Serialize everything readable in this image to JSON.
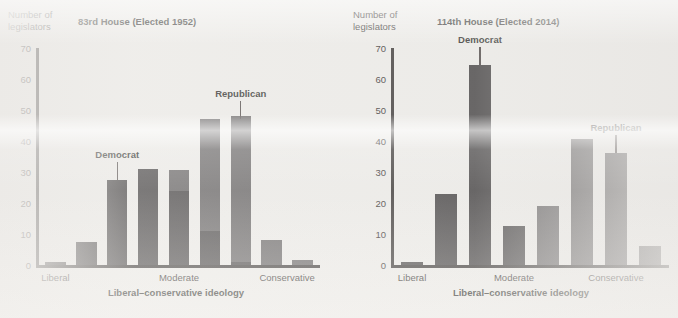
{
  "figure": {
    "background_color": "#ecebe8",
    "democrat_color": "#3c3a3b",
    "republican_color": "#5c5a5b",
    "axis_color": "#2e2b2a"
  },
  "chart_data": [
    {
      "type": "bar",
      "panel": "left",
      "title": "83rd House (Elected 1952)",
      "ylabel": "Number of\nlegislators",
      "xlabel": "Liberal–conservative ideology",
      "ylim": [
        0,
        70
      ],
      "yticks": [
        0,
        10,
        20,
        30,
        40,
        50,
        60,
        70
      ],
      "ytick_labels": [
        "0",
        "10",
        "20",
        "30",
        "40",
        "50",
        "60",
        "70"
      ],
      "grid": false,
      "legend": "annotation",
      "xtick_positions": [
        0.5,
        4.5,
        8.0
      ],
      "categories": [
        "Liberal",
        "Moderate",
        "Conservative"
      ],
      "bin_count": 9,
      "series": [
        {
          "name": "Democrat",
          "values": [
            1,
            7.5,
            27.5,
            31,
            24,
            11,
            1,
            0,
            0
          ]
        },
        {
          "name": "Republican",
          "values": [
            0,
            0,
            0,
            0,
            6.5,
            36,
            47,
            8,
            1.5
          ]
        }
      ],
      "annotations": [
        {
          "text": "Democrat",
          "bin": 2,
          "value": 27.5
        },
        {
          "text": "Republican",
          "bin": 6,
          "value": 47
        }
      ]
    },
    {
      "type": "bar",
      "panel": "right",
      "title": "114th House (Elected 2014)",
      "ylabel": "Number of\nlegislators",
      "xlabel": "Liberal–conservative ideology",
      "ylim": [
        0,
        70
      ],
      "yticks": [
        0,
        10,
        20,
        30,
        40,
        50,
        60,
        70
      ],
      "ytick_labels": [
        "0",
        "10",
        "20",
        "30",
        "40",
        "50",
        "60",
        "70"
      ],
      "grid": false,
      "legend": "annotation",
      "xtick_positions": [
        0.5,
        3.5,
        6.5
      ],
      "categories": [
        "Liberal",
        "Moderate",
        "Conservative"
      ],
      "bin_count": 8,
      "series": [
        {
          "name": "Democrat",
          "values": [
            1,
            23,
            64.5,
            12.5,
            0,
            0,
            0,
            0
          ]
        },
        {
          "name": "Republican",
          "values": [
            0,
            0,
            0,
            0,
            19,
            40.5,
            36,
            6
          ]
        }
      ],
      "annotations": [
        {
          "text": "Democrat",
          "bin": 2,
          "value": 64.5
        },
        {
          "text": "Republican",
          "bin": 6,
          "value": 36
        }
      ]
    }
  ]
}
